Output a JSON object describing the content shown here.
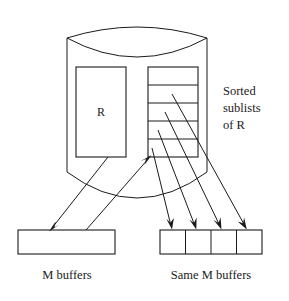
{
  "diagram": {
    "colors": {
      "stroke": "#1a1a1a",
      "fill": "#ffffff",
      "background": "#ffffff"
    },
    "disk": {
      "name": "disk-cylinder",
      "relation_label": "R"
    },
    "sublists": {
      "count": 5,
      "annotation": {
        "line1": "Sorted",
        "line2": "sublists",
        "line3": "of R"
      }
    },
    "buffers_left": {
      "caption": "M buffers",
      "cells": 1
    },
    "buffers_right": {
      "caption": "Same M buffers",
      "cells": 4
    },
    "arrows": {
      "read_relation": "R to M buffers",
      "write_sublists": "M buffers to sorted sublists",
      "merge_1": "sublist 1 to buffer 1",
      "merge_2": "sublist 2 to buffer 2",
      "merge_3": "sublist 3 to buffer 3",
      "merge_4": "sublist 4 to buffer 4"
    }
  }
}
